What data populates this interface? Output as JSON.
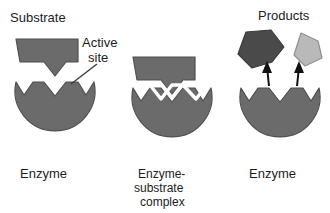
{
  "figure": {
    "background_color": "#ffffff"
  },
  "colors": {
    "enzyme_fill": "#6b6b6b",
    "enzyme_stroke": "#4f4f4f",
    "substrate_fill": "#6b6b6b",
    "substrate_stroke": "#4f4f4f",
    "product_dark_fill": "#4a4a4a",
    "product_dark_stroke": "#3a3a3a",
    "product_light_fill": "#b9b9b9",
    "product_light_stroke": "#8f8f8f",
    "arrow_color": "#111111",
    "gap_color": "#ffffff",
    "text_color": "#1c1c1c",
    "leader_line_color": "#3a3a3a"
  },
  "panels": [
    {
      "id": "panel-1",
      "top_label": "Substrate",
      "bottom_label": "Enzyme",
      "annotation": {
        "line1": "Active",
        "line2": "site"
      },
      "stage": "free substrate above enzyme active site"
    },
    {
      "id": "panel-2",
      "top_label": "",
      "bottom_label": "Enzyme-\nsubstrate\ncomplex",
      "bottom_label_lines": [
        "Enzyme-",
        "substrate",
        "complex"
      ],
      "stage": "substrate bound in active site"
    },
    {
      "id": "panel-3",
      "top_label": "Products",
      "bottom_label": "Enzyme",
      "stage": "products released from enzyme",
      "products_count": 2,
      "arrows": 2
    }
  ],
  "labels": {
    "substrate": "Substrate",
    "products": "Products",
    "enzyme": "Enzyme",
    "active_site_line1": "Active",
    "active_site_line2": "site",
    "complex_line1": "Enzyme-",
    "complex_line2": "substrate",
    "complex_line3": "complex"
  }
}
